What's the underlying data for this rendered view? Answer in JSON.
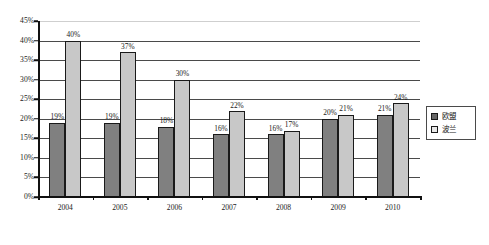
{
  "chart_data": {
    "type": "bar",
    "title": "",
    "subtitle": "",
    "xlabel": "",
    "ylabel": "",
    "categories": [
      "2004",
      "2005",
      "2006",
      "2007",
      "2008",
      "2009",
      "2010"
    ],
    "series": [
      {
        "name": "欧盟",
        "color": "#808080",
        "values": [
          19,
          19,
          18,
          16,
          16,
          20,
          21
        ],
        "labels": [
          "19%",
          "19%",
          "18%",
          "16%",
          "16%",
          "20%",
          "21%"
        ]
      },
      {
        "name": "波兰",
        "color": "#c8c8c8",
        "values": [
          40,
          37,
          30,
          22,
          17,
          21,
          24
        ],
        "labels": [
          "40%",
          "37%",
          "30%",
          "22%",
          "17%",
          "21%",
          "24%"
        ]
      }
    ],
    "ylim": [
      0,
      45
    ],
    "ytick_values": [
      45,
      40,
      35,
      30,
      25,
      20,
      15,
      10,
      5,
      0
    ],
    "ytick_labels": [
      "45%",
      "40%",
      "35%",
      "30%",
      "25%",
      "20%",
      "15%",
      "10%",
      "5%",
      "0%"
    ],
    "grid": true,
    "grid_axis": "y",
    "legend_position": "right",
    "value_labels": true,
    "unit": "%"
  },
  "legend": {
    "items": [
      {
        "label": "欧盟",
        "swatch": "dark-gray-swatch-icon"
      },
      {
        "label": "波兰",
        "swatch": "light-gray-swatch-icon"
      }
    ]
  }
}
